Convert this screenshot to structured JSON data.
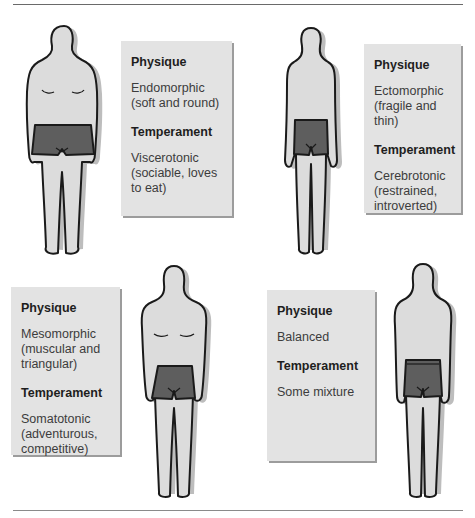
{
  "figure_title": "Sheldon's body types and associated temperaments",
  "colors": {
    "box_fill": "#e3e3e3",
    "box_shadow": "#9c9c9c",
    "skin": "#dcdcdc",
    "shorts": "#5e5e5e",
    "outline": "#1a1a1a"
  },
  "panels": [
    {
      "id": "endomorph",
      "physique_label": "Physique",
      "physique_value": "Endomorphic (soft and round)",
      "temperament_label": "Temperament",
      "temperament_value": "Viscerotonic (sociable, loves to eat)",
      "figure_icon": "endomorph-body-figure"
    },
    {
      "id": "ectomorph",
      "physique_label": "Physique",
      "physique_value": "Ectomorphic (fragile and thin)",
      "temperament_label": "Temperament",
      "temperament_value": "Cerebrotonic (restrained, introverted)",
      "figure_icon": "ectomorph-body-figure"
    },
    {
      "id": "mesomorph",
      "physique_label": "Physique",
      "physique_value": "Mesomorphic (muscular and triangular)",
      "temperament_label": "Temperament",
      "temperament_value": "Somatotonic (adventurous, competitive)",
      "figure_icon": "mesomorph-body-figure"
    },
    {
      "id": "balanced",
      "physique_label": "Physique",
      "physique_value": "Balanced",
      "temperament_label": "Temperament",
      "temperament_value": "Some mixture",
      "figure_icon": "balanced-body-figure"
    }
  ]
}
